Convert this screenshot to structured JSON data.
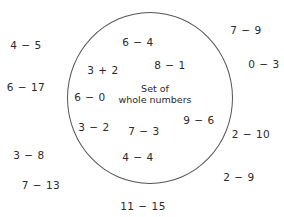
{
  "diagram": {
    "set_label": {
      "line1": "Set of",
      "line2": "whole numbers"
    },
    "inside": [
      {
        "text": "6 − 4",
        "x": 138,
        "y": 42
      },
      {
        "text": "8 − 1",
        "x": 170,
        "y": 65
      },
      {
        "text": "3 + 2",
        "x": 103,
        "y": 70
      },
      {
        "text": "6 − 0",
        "x": 90,
        "y": 97
      },
      {
        "text": "9 − 6",
        "x": 199,
        "y": 120
      },
      {
        "text": "3 − 2",
        "x": 94,
        "y": 127
      },
      {
        "text": "7 − 3",
        "x": 144,
        "y": 131
      },
      {
        "text": "4 − 4",
        "x": 138,
        "y": 157
      }
    ],
    "outside": [
      {
        "text": "4 − 5",
        "x": 26,
        "y": 45
      },
      {
        "text": "6 − 17",
        "x": 26,
        "y": 87
      },
      {
        "text": "7 − 9",
        "x": 246,
        "y": 30
      },
      {
        "text": "0 − 3",
        "x": 264,
        "y": 64
      },
      {
        "text": "2 − 10",
        "x": 251,
        "y": 134
      },
      {
        "text": "3 − 8",
        "x": 29,
        "y": 155
      },
      {
        "text": "7 − 13",
        "x": 41,
        "y": 185
      },
      {
        "text": "2 − 9",
        "x": 239,
        "y": 177
      },
      {
        "text": "11 − 15",
        "x": 143,
        "y": 206
      }
    ]
  }
}
